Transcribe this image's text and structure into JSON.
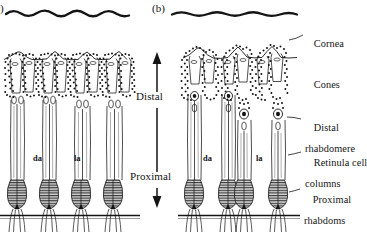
{
  "figure": {
    "background_color": "#ffffff",
    "ink_color": "#141414"
  },
  "panels": [
    {
      "id": "a",
      "label": ")",
      "note": "panel label cut off at left image edge"
    },
    {
      "id": "b",
      "label": "(b)"
    }
  ],
  "axis": {
    "top_label": "Distal",
    "bottom_label": "Proximal"
  },
  "inline_labels": {
    "dark_adapted": "da",
    "light_adapted": "la"
  },
  "side_labels": [
    {
      "name": "cornea",
      "line1": "Cornea",
      "line2": ""
    },
    {
      "name": "cones",
      "line1": "Cones",
      "line2": ""
    },
    {
      "name": "distal-rhabdomere",
      "line1": "Distal",
      "line2": "rhabdomere"
    },
    {
      "name": "retinula-cell-columns",
      "line1": "Retinula cell",
      "line2": "columns"
    },
    {
      "name": "proximal-rhabdoms",
      "line1": "Proximal",
      "line2": "rhabdoms"
    }
  ]
}
